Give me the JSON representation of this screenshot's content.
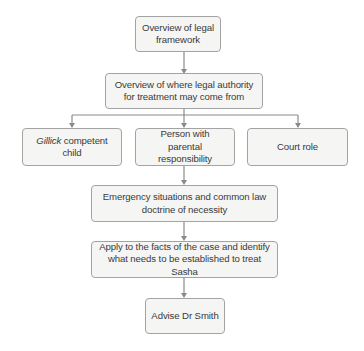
{
  "diagram": {
    "type": "flowchart",
    "nodes": [
      {
        "id": "n1",
        "label_line1": "Overview of legal",
        "label_line2": "framework"
      },
      {
        "id": "n2",
        "label_line1": "Overview of where legal authority",
        "label_line2": "for treatment may come from"
      },
      {
        "id": "n3",
        "label_italic": "Gillick",
        "label_rest": " competent child"
      },
      {
        "id": "n4",
        "label_line1": "Person with",
        "label_line2": "parental responsibility"
      },
      {
        "id": "n5",
        "label": "Court role"
      },
      {
        "id": "n6",
        "label_line1": "Emergency situations and common law",
        "label_line2": "doctrine of necessity"
      },
      {
        "id": "n7",
        "label_line1": "Apply to the facts of the case and identify",
        "label_line2": "what needs to be established to treat Sasha"
      },
      {
        "id": "n8",
        "label": "Advise Dr Smith"
      }
    ],
    "edges": [
      {
        "from": "n1",
        "to": "n2"
      },
      {
        "from": "n2",
        "to": "n3"
      },
      {
        "from": "n2",
        "to": "n4"
      },
      {
        "from": "n2",
        "to": "n5"
      },
      {
        "from": "n4",
        "to": "n6"
      },
      {
        "from": "n6",
        "to": "n7"
      },
      {
        "from": "n7",
        "to": "n8"
      }
    ],
    "colors": {
      "box_border": "#a3a3a3",
      "box_fill": "#f5f5f4",
      "connector": "#8a8a8a",
      "text": "#3a3a3a"
    }
  }
}
